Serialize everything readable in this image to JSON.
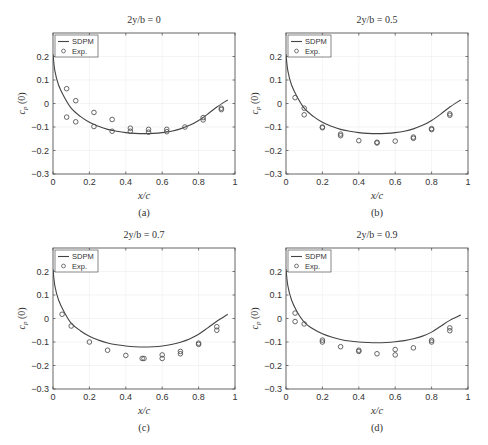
{
  "figure": {
    "captions": [
      "(a)",
      "(b)",
      "(c)",
      "(d)"
    ]
  },
  "chart_data": [
    {
      "type": "line",
      "panel": "(a)",
      "title": "2y/b = 0",
      "xlabel": "x/c",
      "ylabel": "c_p (0)",
      "xlim": [
        0,
        1
      ],
      "ylim": [
        -0.3,
        0.3
      ],
      "xticks": [
        "0",
        "0.2",
        "0.4",
        "0.6",
        "0.8",
        "1"
      ],
      "yticks": [
        "-0.3",
        "-0.2",
        "-0.1",
        "0",
        "0.1",
        "0.2"
      ],
      "grid": true,
      "legend": {
        "position": "upper left",
        "entries": [
          "SDPM",
          "Exp."
        ]
      },
      "series": [
        {
          "name": "SDPM",
          "style": "line",
          "x": [
            0,
            0.01,
            0.03,
            0.06,
            0.1,
            0.15,
            0.2,
            0.25,
            0.3,
            0.35,
            0.4,
            0.45,
            0.5,
            0.55,
            0.6,
            0.65,
            0.7,
            0.75,
            0.8,
            0.85,
            0.9,
            0.96
          ],
          "y": [
            0.21,
            0.14,
            0.08,
            0.03,
            -0.02,
            -0.055,
            -0.08,
            -0.097,
            -0.11,
            -0.118,
            -0.124,
            -0.127,
            -0.128,
            -0.127,
            -0.124,
            -0.118,
            -0.108,
            -0.093,
            -0.072,
            -0.045,
            -0.015,
            0.015
          ]
        },
        {
          "name": "Exp.",
          "style": "marker-circle",
          "x": [
            0.075,
            0.075,
            0.125,
            0.125,
            0.225,
            0.225,
            0.325,
            0.325,
            0.425,
            0.425,
            0.525,
            0.525,
            0.625,
            0.625,
            0.725,
            0.825,
            0.825,
            0.925,
            0.925
          ],
          "y": [
            0.063,
            -0.058,
            0.012,
            -0.078,
            -0.038,
            -0.098,
            -0.068,
            -0.118,
            -0.105,
            -0.118,
            -0.11,
            -0.122,
            -0.11,
            -0.12,
            -0.1,
            -0.06,
            -0.07,
            -0.02,
            -0.026
          ]
        }
      ]
    },
    {
      "type": "line",
      "panel": "(b)",
      "title": "2y/b = 0.5",
      "xlabel": "x/c",
      "ylabel": "c_p (0)",
      "xlim": [
        0,
        1
      ],
      "ylim": [
        -0.3,
        0.3
      ],
      "xticks": [
        "0",
        "0.2",
        "0.4",
        "0.6",
        "0.8",
        "1"
      ],
      "yticks": [
        "-0.3",
        "-0.2",
        "-0.1",
        "0",
        "0.1",
        "0.2"
      ],
      "grid": true,
      "legend": {
        "position": "upper left",
        "entries": [
          "SDPM",
          "Exp."
        ]
      },
      "series": [
        {
          "name": "SDPM",
          "style": "line",
          "x": [
            0,
            0.01,
            0.03,
            0.06,
            0.1,
            0.15,
            0.2,
            0.25,
            0.3,
            0.35,
            0.4,
            0.45,
            0.5,
            0.55,
            0.6,
            0.65,
            0.7,
            0.75,
            0.8,
            0.85,
            0.9,
            0.96
          ],
          "y": [
            0.21,
            0.14,
            0.08,
            0.03,
            -0.02,
            -0.055,
            -0.08,
            -0.097,
            -0.11,
            -0.118,
            -0.124,
            -0.127,
            -0.128,
            -0.127,
            -0.124,
            -0.118,
            -0.108,
            -0.093,
            -0.072,
            -0.045,
            -0.015,
            0.015
          ]
        },
        {
          "name": "Exp.",
          "style": "marker-circle",
          "x": [
            0.05,
            0.1,
            0.1,
            0.2,
            0.2,
            0.3,
            0.3,
            0.4,
            0.5,
            0.5,
            0.6,
            0.7,
            0.7,
            0.8,
            0.8,
            0.9,
            0.9
          ],
          "y": [
            0.025,
            -0.02,
            -0.048,
            -0.1,
            -0.103,
            -0.13,
            -0.137,
            -0.158,
            -0.165,
            -0.168,
            -0.16,
            -0.143,
            -0.148,
            -0.107,
            -0.111,
            -0.044,
            -0.05
          ]
        }
      ]
    },
    {
      "type": "line",
      "panel": "(c)",
      "title": "2y/b = 0.7",
      "xlabel": "x/c",
      "ylabel": "c_p (0)",
      "xlim": [
        0,
        1
      ],
      "ylim": [
        -0.3,
        0.3
      ],
      "xticks": [
        "0",
        "0.2",
        "0.4",
        "0.6",
        "0.8",
        "1"
      ],
      "yticks": [
        "-0.3",
        "-0.2",
        "-0.1",
        "0",
        "0.1",
        "0.2"
      ],
      "grid": true,
      "legend": {
        "position": "upper left",
        "entries": [
          "SDPM",
          "Exp."
        ]
      },
      "series": [
        {
          "name": "SDPM",
          "style": "line",
          "x": [
            0,
            0.01,
            0.03,
            0.06,
            0.1,
            0.15,
            0.2,
            0.25,
            0.3,
            0.35,
            0.4,
            0.45,
            0.5,
            0.55,
            0.6,
            0.65,
            0.7,
            0.75,
            0.8,
            0.85,
            0.9,
            0.96
          ],
          "y": [
            0.21,
            0.14,
            0.08,
            0.03,
            -0.02,
            -0.052,
            -0.076,
            -0.092,
            -0.104,
            -0.112,
            -0.117,
            -0.12,
            -0.121,
            -0.12,
            -0.117,
            -0.111,
            -0.101,
            -0.087,
            -0.067,
            -0.04,
            -0.012,
            0.018
          ]
        },
        {
          "name": "Exp.",
          "style": "marker-circle",
          "x": [
            0.05,
            0.1,
            0.2,
            0.3,
            0.4,
            0.49,
            0.5,
            0.6,
            0.6,
            0.7,
            0.7,
            0.8,
            0.8,
            0.9,
            0.9
          ],
          "y": [
            0.018,
            -0.032,
            -0.1,
            -0.135,
            -0.157,
            -0.17,
            -0.17,
            -0.155,
            -0.17,
            -0.14,
            -0.15,
            -0.105,
            -0.11,
            -0.035,
            -0.05
          ]
        }
      ]
    },
    {
      "type": "line",
      "panel": "(d)",
      "title": "2y/b = 0.9",
      "xlabel": "x/c",
      "ylabel": "c_p (0)",
      "xlim": [
        0,
        1
      ],
      "ylim": [
        -0.3,
        0.3
      ],
      "xticks": [
        "0",
        "0.2",
        "0.4",
        "0.6",
        "0.8",
        "1"
      ],
      "yticks": [
        "-0.3",
        "-0.2",
        "-0.1",
        "0",
        "0.1",
        "0.2"
      ],
      "grid": true,
      "legend": {
        "position": "upper left",
        "entries": [
          "SDPM",
          "Exp."
        ]
      },
      "series": [
        {
          "name": "SDPM",
          "style": "line",
          "x": [
            0,
            0.01,
            0.03,
            0.06,
            0.1,
            0.15,
            0.2,
            0.25,
            0.3,
            0.35,
            0.4,
            0.45,
            0.5,
            0.55,
            0.6,
            0.65,
            0.7,
            0.75,
            0.8,
            0.85,
            0.9,
            0.96
          ],
          "y": [
            0.21,
            0.14,
            0.08,
            0.03,
            -0.015,
            -0.045,
            -0.065,
            -0.079,
            -0.089,
            -0.096,
            -0.1,
            -0.102,
            -0.103,
            -0.102,
            -0.099,
            -0.094,
            -0.086,
            -0.075,
            -0.058,
            -0.033,
            -0.008,
            0.015
          ]
        },
        {
          "name": "Exp.",
          "style": "marker-circle",
          "x": [
            0.05,
            0.05,
            0.1,
            0.2,
            0.2,
            0.3,
            0.4,
            0.4,
            0.5,
            0.6,
            0.6,
            0.7,
            0.8,
            0.8,
            0.9,
            0.9
          ],
          "y": [
            0.023,
            -0.013,
            -0.023,
            -0.092,
            -0.1,
            -0.12,
            -0.135,
            -0.14,
            -0.15,
            -0.132,
            -0.155,
            -0.125,
            -0.093,
            -0.1,
            -0.04,
            -0.052
          ]
        }
      ]
    }
  ]
}
